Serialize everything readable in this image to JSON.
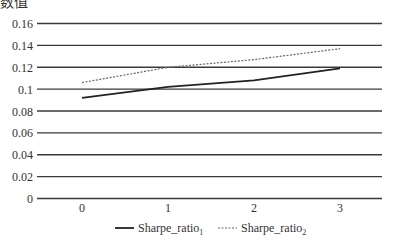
{
  "clipped_label": "数值",
  "chart_data": {
    "type": "line",
    "title": "",
    "xlabel": "",
    "ylabel": "",
    "categories": [
      "0",
      "1",
      "2",
      "3"
    ],
    "x": [
      0,
      1,
      2,
      3
    ],
    "ylim": [
      0,
      0.16
    ],
    "yticks": [
      "0",
      "0.02",
      "0.04",
      "0.06",
      "0.08",
      "0.1",
      "0.12",
      "0.14",
      "0.16"
    ],
    "ytick_values": [
      0,
      0.02,
      0.04,
      0.06,
      0.08,
      0.1,
      0.12,
      0.14,
      0.16
    ],
    "grid": true,
    "legend_position": "bottom",
    "series": [
      {
        "name": "Sharpe_ratio",
        "subscript": "1",
        "style": "solid",
        "color": "#222222",
        "values": [
          0.092,
          0.102,
          0.108,
          0.119
        ]
      },
      {
        "name": "Sharpe_ratio",
        "subscript": "2",
        "style": "dashed",
        "color": "#666666",
        "values": [
          0.106,
          0.12,
          0.127,
          0.137
        ]
      }
    ]
  }
}
